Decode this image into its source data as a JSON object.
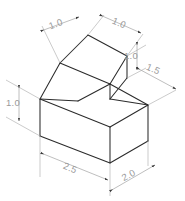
{
  "drawing": {
    "title": "Isometric pictorial of stepped block with ramp",
    "type": "isometric-technical-drawing",
    "background_color": "#ffffff",
    "edge_color": "#2b2b2b",
    "dimension_line_color": "#a8a8a8",
    "dimension_text_color": "#9a9a9a",
    "arrow_color": "#3a3a3a"
  },
  "dimensions": [
    {
      "id": "top-left-width",
      "label": "1.0",
      "orientation": "isometric-left",
      "text_x": 57,
      "text_y": 27,
      "describes": "width of top face along left isometric axis"
    },
    {
      "id": "top-right-depth",
      "label": "1.0",
      "orientation": "isometric-right",
      "text_x": 117,
      "text_y": 27,
      "describes": "depth of top face along right isometric axis"
    },
    {
      "id": "right-upper-height",
      "label": "1.0",
      "orientation": "vertical",
      "text_x": 131,
      "text_y": 52,
      "describes": "height of raised block above the base"
    },
    {
      "id": "right-depth",
      "label": "1.5",
      "orientation": "isometric-right",
      "text_x": 151,
      "text_y": 72,
      "describes": "depth of upper step region"
    },
    {
      "id": "left-height",
      "label": "1.0",
      "orientation": "vertical",
      "text_x": 13,
      "text_y": 97,
      "describes": "height of base block"
    },
    {
      "id": "bottom-left-length",
      "label": "2.5",
      "orientation": "isometric-left",
      "text_x": 66,
      "text_y": 170,
      "describes": "overall length of base along left isometric axis"
    },
    {
      "id": "bottom-right-width",
      "label": "2.0",
      "orientation": "isometric-right",
      "text_x": 128,
      "text_y": 176,
      "describes": "overall width of base along right isometric axis"
    }
  ]
}
